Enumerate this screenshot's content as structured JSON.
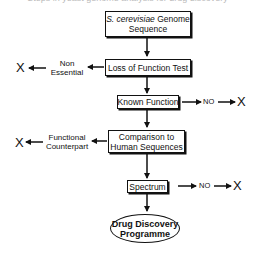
{
  "cut_title": "Steps in yeast genome analysis for drug discovery",
  "nodes": {
    "genome": {
      "line1_italic": "S. cerevisiae",
      "line1_rest": " Genome",
      "line2": "Sequence"
    },
    "loss_test": {
      "label": "Loss of Function Test"
    },
    "known_function": {
      "label": "Known Function"
    },
    "comparison": {
      "line1": "Comparison to",
      "line2": "Human Sequences"
    },
    "spectrum": {
      "label": "Spectrum"
    },
    "drug_discovery": {
      "line1": "Drug Discovery",
      "line2": "Programme"
    }
  },
  "branches": {
    "non_essential": {
      "line1": "Non",
      "line2": "Essential",
      "end": "X"
    },
    "known_no": {
      "no": "NO",
      "end": "X"
    },
    "functional_counterpart": {
      "line1": "Functional",
      "line2": "Counterpart",
      "end": "X"
    },
    "spectrum_no": {
      "no": "NO",
      "end": "X"
    }
  }
}
